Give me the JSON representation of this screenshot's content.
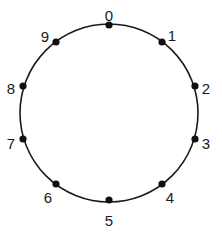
{
  "diagram": {
    "type": "circle-with-labeled-points",
    "circle": {
      "cx": 109,
      "cy": 113,
      "r": 89,
      "stroke": "#1a1a1a"
    },
    "points": [
      {
        "label": "0",
        "x": 109,
        "y": 25,
        "lx": 109,
        "ly": 17
      },
      {
        "label": "1",
        "x": 162,
        "y": 42,
        "lx": 172,
        "ly": 37
      },
      {
        "label": "2",
        "x": 195,
        "y": 86,
        "lx": 206,
        "ly": 90
      },
      {
        "label": "3",
        "x": 195,
        "y": 139,
        "lx": 206,
        "ly": 145
      },
      {
        "label": "4",
        "x": 162,
        "y": 184,
        "lx": 170,
        "ly": 199
      },
      {
        "label": "5",
        "x": 109,
        "y": 200,
        "lx": 109,
        "ly": 222
      },
      {
        "label": "6",
        "x": 56,
        "y": 184,
        "lx": 48,
        "ly": 199
      },
      {
        "label": "7",
        "x": 23,
        "y": 139,
        "lx": 11,
        "ly": 145
      },
      {
        "label": "8",
        "x": 23,
        "y": 86,
        "lx": 11,
        "ly": 90
      },
      {
        "label": "9",
        "x": 56,
        "y": 42,
        "lx": 45,
        "ly": 38
      }
    ]
  }
}
